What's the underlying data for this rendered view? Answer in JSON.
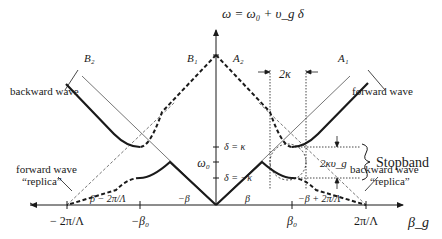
{
  "figure": {
    "type": "dispersion-diagram",
    "y_axis_label": "ω = ω₀ + υ_g δ",
    "x_axis_label": "β_g",
    "x_ticks": [
      "− 2π/Λ",
      "−β₀",
      "β₀",
      "2π/Λ"
    ],
    "y_ticks": [
      "δ = κ",
      "ω₀",
      "δ = −κ"
    ],
    "point_labels": {
      "B2": "B₂",
      "B1": "B₁",
      "A2": "A₂",
      "A1": "A₁"
    },
    "line_labels": {
      "beta_minus": "β − 2π/Λ",
      "neg_beta": "−β",
      "beta": "β",
      "neg_beta_plus": "−β + 2π/Λ"
    },
    "annotations": {
      "backward_wave": "backward wave",
      "forward_wave": "forward wave",
      "forward_wave_replica_1": "forward wave",
      "forward_wave_replica_2": "“replica”",
      "backward_wave_replica_1": "backward wave",
      "backward_wave_replica_2": "“replica”",
      "two_kappa": "2κ",
      "two_kappa_vg": "2κυ_g",
      "stopband": "Stopband"
    },
    "colors": {
      "ink": "#1a1a1a",
      "background": "#ffffff"
    }
  }
}
